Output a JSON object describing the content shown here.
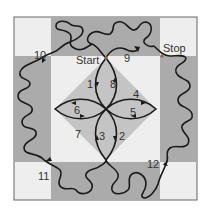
{
  "diagram": {
    "type": "quilting-path-diagram",
    "colors": {
      "light": "#eeeeee",
      "medium": "#bdbdbd",
      "dark": "#a9a9a9",
      "line": "#1a1a1a",
      "border": "#555555"
    },
    "labels": {
      "start": "Start",
      "stop": "Stop",
      "steps": [
        "1",
        "2",
        "3",
        "4",
        "5",
        "6",
        "7",
        "8",
        "9",
        "10",
        "11",
        "12"
      ]
    }
  }
}
